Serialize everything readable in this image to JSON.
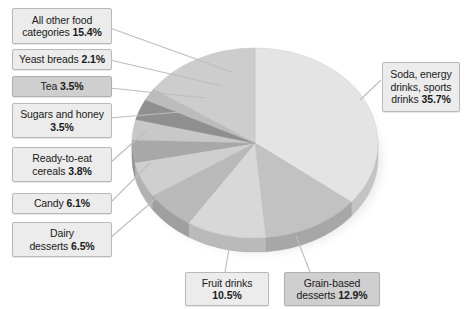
{
  "chart_data": {
    "type": "pie",
    "title": "",
    "subtitle": "",
    "xlabel": "",
    "ylabel": "",
    "legend_position": "callout-labels",
    "grid": false,
    "units": "percent",
    "start_angle_deg": 0,
    "direction": "clockwise",
    "three_d": true,
    "categories": [
      "Soda, energy drinks, sports drinks",
      "Grain-based desserts",
      "Fruit drinks",
      "Dairy desserts",
      "Candy",
      "Ready-to-eat cereals",
      "Sugars and honey",
      "Tea",
      "Yeast breads",
      "All other food categories"
    ],
    "values": [
      35.7,
      12.9,
      10.5,
      6.5,
      6.1,
      3.8,
      3.5,
      3.5,
      2.1,
      15.4
    ],
    "value_labels": [
      "35.7%",
      "12.9%",
      "10.5%",
      "6.5%",
      "6.1%",
      "3.8%",
      "3.5%",
      "3.5%",
      "2.1%",
      "15.4%"
    ],
    "colors": [
      "#e4e4e4",
      "#c2c2c2",
      "#d8d8d8",
      "#b9b9b9",
      "#cfcfcf",
      "#a8a8a8",
      "#c8c8c8",
      "#8f8f8f",
      "#bcbcbc",
      "#cdcdcd"
    ],
    "total": 100.0
  },
  "callouts": {
    "all_other_food": {
      "line1": "All other food",
      "line2_text": "categories ",
      "line2_value": "15.4%"
    },
    "yeast_breads": {
      "line1_text": "Yeast breads ",
      "line1_value": "2.1%"
    },
    "tea": {
      "line1_text": "Tea ",
      "line1_value": "3.5%"
    },
    "sugars_honey": {
      "line1": "Sugars and honey",
      "line2_value": "3.5%"
    },
    "rte_cereals": {
      "line1": "Ready-to-eat",
      "line2_text": "cereals ",
      "line2_value": "3.8%"
    },
    "candy": {
      "line1_text": "Candy ",
      "line1_value": "6.1%"
    },
    "dairy_desserts": {
      "line1": "Dairy",
      "line2_text": "desserts ",
      "line2_value": "6.5%"
    },
    "fruit_drinks": {
      "line1": "Fruit drinks",
      "line2_value": "10.5%"
    },
    "grain_desserts": {
      "line1": "Grain-based",
      "line2_text": "desserts ",
      "line2_value": "12.9%"
    },
    "soda": {
      "line1": "Soda, energy",
      "line2": "drinks, sports",
      "line3_text": "drinks ",
      "line3_value": "35.7%"
    }
  },
  "style": {
    "background": "#ffffff",
    "callout_fill": "#ececec",
    "callout_fill_shaded": "#cfcfcf",
    "callout_border": "#b9b9b9",
    "leader_line": "#bdbdbd",
    "text_color": "#1a1a1a"
  }
}
